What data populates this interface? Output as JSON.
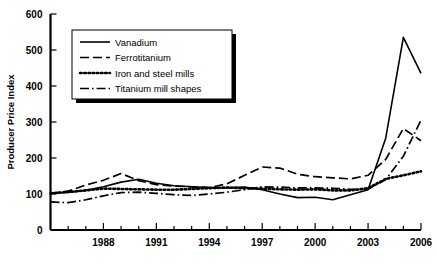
{
  "chart_data": {
    "type": "line",
    "title": "",
    "xlabel": "",
    "ylabel": "Producer Price Index",
    "xlim": [
      1985,
      2006
    ],
    "ylim": [
      0,
      600
    ],
    "grid": false,
    "legend_position": "top-left",
    "x": [
      1985,
      1986,
      1987,
      1988,
      1989,
      1990,
      1991,
      1992,
      1993,
      1994,
      1995,
      1996,
      1997,
      1998,
      1999,
      2000,
      2001,
      2002,
      2003,
      2004,
      2005,
      2006
    ],
    "x_tick_labels": [
      "1988",
      "1991",
      "1994",
      "1997",
      "2000",
      "2003",
      "2006"
    ],
    "x_tick_values": [
      1988,
      1991,
      1994,
      1997,
      2000,
      2003,
      2006
    ],
    "y_tick_labels": [
      "0",
      "100",
      "200",
      "300",
      "400",
      "500",
      "600"
    ],
    "y_tick_values": [
      0,
      100,
      200,
      300,
      400,
      500,
      600
    ],
    "series": [
      {
        "name": "Vanadium",
        "style": "solid",
        "color": "#000000",
        "values": [
          102,
          104,
          110,
          120,
          133,
          141,
          130,
          123,
          120,
          118,
          117,
          119,
          112,
          100,
          90,
          91,
          84,
          98,
          112,
          255,
          535,
          435
        ]
      },
      {
        "name": "Ferrotitanium",
        "style": "dashed",
        "color": "#000000",
        "values": [
          101,
          108,
          125,
          138,
          157,
          137,
          126,
          122,
          120,
          118,
          128,
          152,
          175,
          172,
          155,
          148,
          145,
          142,
          152,
          196,
          282,
          248
        ]
      },
      {
        "name": "Iron and steel mills",
        "style": "dotted",
        "color": "#000000",
        "values": [
          102,
          106,
          110,
          115,
          114,
          113,
          112,
          112,
          114,
          116,
          118,
          116,
          115,
          113,
          112,
          113,
          110,
          110,
          116,
          142,
          152,
          163
        ]
      },
      {
        "name": "Titanium mill shapes",
        "style": "dashdot",
        "color": "#000000",
        "values": [
          78,
          76,
          84,
          95,
          104,
          105,
          102,
          98,
          96,
          100,
          105,
          112,
          120,
          119,
          117,
          117,
          116,
          113,
          113,
          140,
          205,
          305
        ]
      }
    ]
  },
  "axis": {
    "y_title": "Producer Price Index"
  },
  "legend": {
    "items": [
      {
        "label": "Vanadium",
        "style": "solid"
      },
      {
        "label": "Ferrotitanium",
        "style": "dashed"
      },
      {
        "label": "Iron and steel mills",
        "style": "dotted"
      },
      {
        "label": "Titanium mill shapes",
        "style": "dashdot"
      }
    ]
  }
}
